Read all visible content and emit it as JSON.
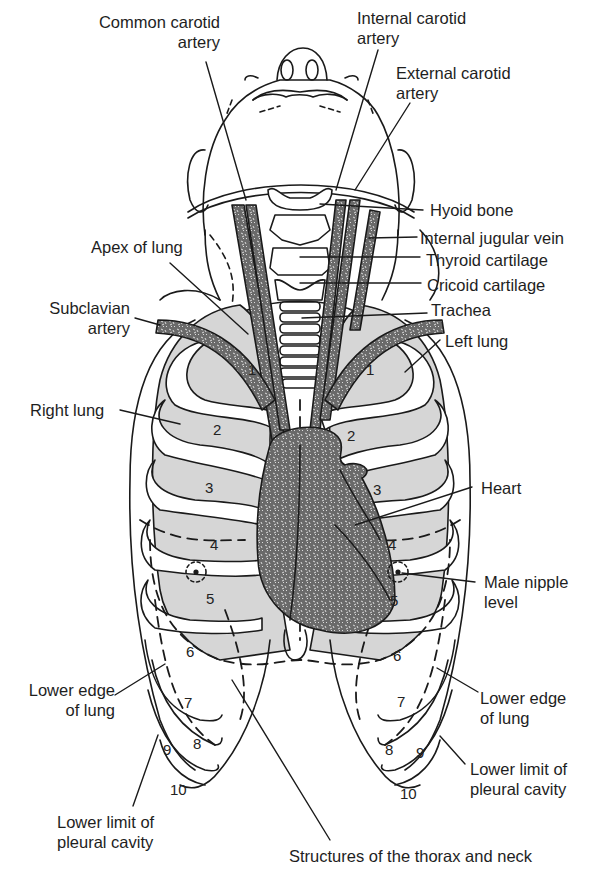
{
  "figure": {
    "caption": "Structures of the thorax and neck",
    "colors": {
      "line": "#1a1a1a",
      "lung_fill": "#d4d4d4",
      "vessel_fill": "#6a6a6a",
      "heart_fill": "#6e6e6e",
      "background": "#ffffff"
    },
    "labels": {
      "common_carotid": [
        "Common carotid",
        "artery"
      ],
      "internal_carotid": [
        "Internal carotid",
        "artery"
      ],
      "external_carotid": [
        "External carotid",
        "artery"
      ],
      "hyoid_bone": "Hyoid bone",
      "internal_jugular": "Internal jugular vein",
      "thyroid_cartilage": "Thyroid cartilage",
      "cricoid_cartilage": "Cricoid cartilage",
      "trachea": "Trachea",
      "apex_of_lung": "Apex of lung",
      "subclavian_artery": [
        "Subclavian",
        "artery"
      ],
      "left_lung": "Left lung",
      "right_lung": "Right lung",
      "heart": "Heart",
      "male_nipple_level": [
        "Male nipple",
        "level"
      ],
      "lower_edge_lung_left": [
        "Lower edge",
        "of lung"
      ],
      "lower_edge_lung_right": [
        "Lower edge",
        "of lung"
      ],
      "lower_limit_pleural_left": [
        "Lower limit of",
        "pleural cavity"
      ],
      "lower_limit_pleural_right": [
        "Lower limit of",
        "pleural cavity"
      ]
    },
    "rib_numbers": {
      "right_side": [
        "1",
        "2",
        "3",
        "4",
        "5",
        "6",
        "7",
        "8",
        "9",
        "10"
      ],
      "left_side": [
        "1",
        "2",
        "3",
        "4",
        "5",
        "6",
        "7",
        "8",
        "9",
        "10"
      ]
    }
  }
}
